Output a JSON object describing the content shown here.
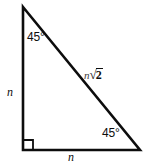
{
  "figure": {
    "type": "geometry-diagram",
    "shape": "right-isosceles-triangle",
    "background_color": "#ffffff",
    "stroke_color": "#0d0d0d",
    "vertices": {
      "apex": [
        23,
        7
      ],
      "right_angle": [
        23,
        150
      ],
      "bottom_right": [
        140,
        150
      ]
    },
    "right_angle_marker": {
      "name": "right-angle-square",
      "size": 10,
      "at": [
        23,
        150
      ]
    },
    "angles": {
      "top": "45°",
      "bottom_right": "45°",
      "bottom_left": "90°"
    },
    "sides": {
      "vertical_leg": "n",
      "horizontal_leg": "n",
      "hypotenuse_variable": "n",
      "hypotenuse_radical_sign": "√",
      "hypotenuse_radicand": "2",
      "hypotenuse_full": "n√2"
    }
  }
}
